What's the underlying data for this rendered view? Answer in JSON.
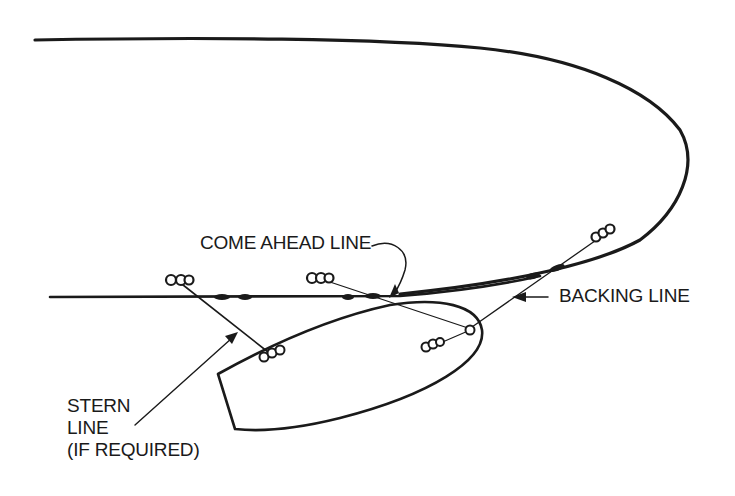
{
  "figure": {
    "type": "mooring diagram"
  },
  "colors": {
    "ink": "#1a1a1a",
    "background": "#ffffff"
  },
  "labels": {
    "come_ahead": "COME AHEAD LINE",
    "backing": "BACKING LINE",
    "stern_line_1": "STERN",
    "stern_line_2": "LINE",
    "stern_line_3": "(IF REQUIRED)"
  },
  "elements": {
    "pier": "pier-outline",
    "boat": "boat-hull",
    "pier_bollards": 3,
    "boat_cleats": 3
  }
}
